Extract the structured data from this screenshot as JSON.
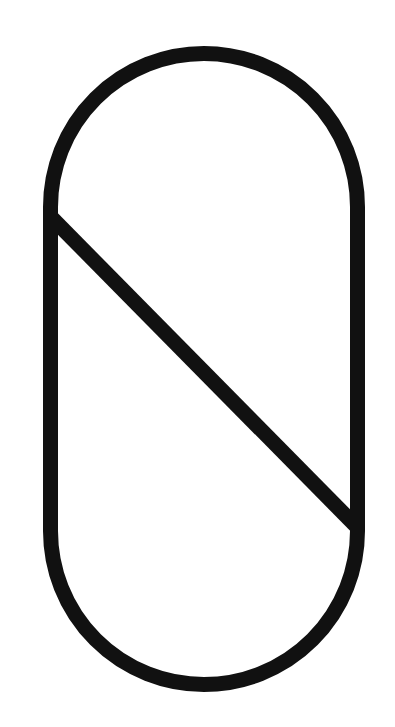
{
  "figure": {
    "icon": "pill-slash-icon",
    "colors": {
      "stroke": "#111111",
      "background": "#ffffff"
    },
    "stroke_width": 15,
    "pill": {
      "x": 50.5,
      "y": 53.5,
      "width": 307,
      "height": 631,
      "corner_radius": 153.5
    },
    "slash": {
      "x1": 50,
      "y1": 216,
      "x2": 354,
      "y2": 524
    }
  }
}
